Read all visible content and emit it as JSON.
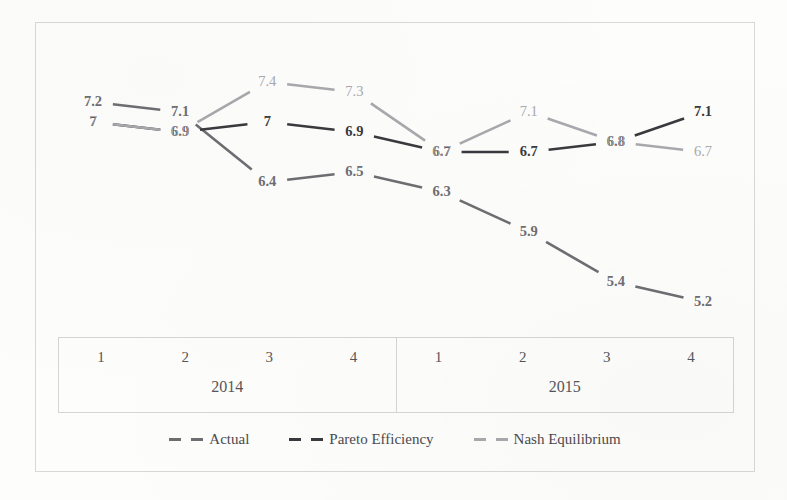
{
  "chart_data": {
    "type": "line",
    "title": "",
    "xlabel": "",
    "ylabel": "",
    "x": [
      "2014 Q1",
      "2014 Q2",
      "2014 Q3",
      "2014 Q4",
      "2015 Q1",
      "2015 Q2",
      "2015 Q3",
      "2015 Q4"
    ],
    "categories": [
      "1",
      "2",
      "3",
      "4",
      "1",
      "2",
      "3",
      "4"
    ],
    "groups": [
      {
        "label": "2014",
        "quarters": [
          "1",
          "2",
          "3",
          "4"
        ]
      },
      {
        "label": "2015",
        "quarters": [
          "1",
          "2",
          "3",
          "4"
        ]
      }
    ],
    "grid": false,
    "legend_position": "bottom",
    "ylim": [
      5.0,
      7.6
    ],
    "series": [
      {
        "name": "Actual",
        "color": "#6e6e72",
        "values": [
          7.2,
          7.1,
          6.4,
          6.5,
          6.3,
          5.9,
          5.4,
          5.2
        ],
        "labels": [
          "7.2",
          "7.1",
          "6.4",
          "6.5",
          "6.3",
          "5.9",
          "5.4",
          "5.2"
        ]
      },
      {
        "name": "Pareto Efficiency",
        "color": "#3a3a3e",
        "values": [
          7.0,
          6.9,
          7.0,
          6.9,
          6.7,
          6.7,
          6.8,
          7.1
        ],
        "labels": [
          "7",
          "6.9",
          "7",
          "6.9",
          "6.7",
          "6.7",
          "6.8",
          "7.1"
        ]
      },
      {
        "name": "Nash Equilibrium",
        "color": "#a9a9ad",
        "values": [
          7.0,
          6.9,
          7.4,
          7.3,
          6.7,
          7.1,
          6.8,
          6.7
        ],
        "labels": [
          "7",
          "6.9",
          "7.4",
          "7.3",
          "6.7",
          "7.1",
          "6.8",
          "6.7"
        ]
      }
    ]
  },
  "legend": {
    "items": [
      {
        "label": "Actual",
        "color": "#6e6e72"
      },
      {
        "label": "Pareto Efficiency",
        "color": "#3a3a3e"
      },
      {
        "label": "Nash Equilibrium",
        "color": "#a9a9ad"
      }
    ]
  }
}
